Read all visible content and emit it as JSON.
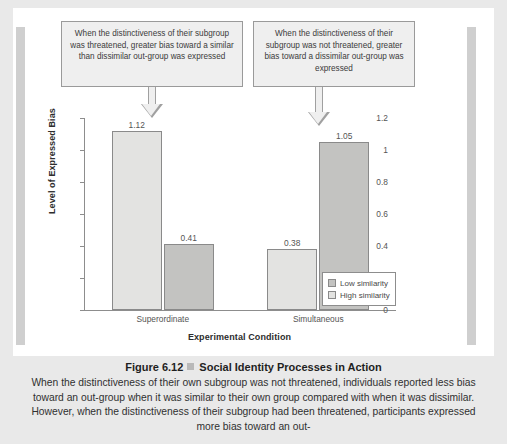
{
  "chart_data": {
    "type": "bar",
    "title": "",
    "xlabel": "Experimental Condition",
    "ylabel": "Level of Expressed Bias",
    "ylim": [
      0,
      1.2
    ],
    "yticks": [
      "0",
      "0.2",
      "0.4",
      "0.6",
      "0.8",
      "1",
      "1.2"
    ],
    "ytick_values": [
      0,
      0.2,
      0.4,
      0.6,
      0.8,
      1,
      1.2
    ],
    "grid": false,
    "legend_position": "bottom-right",
    "categories": [
      "Superordinate",
      "Simultaneous"
    ],
    "series": [
      {
        "name": "High similarity",
        "values": [
          1.12,
          0.38
        ],
        "color": "#e3e3e1"
      },
      {
        "name": "Low similarity",
        "values": [
          0.41,
          1.05
        ],
        "color": "#c3c3c1"
      }
    ],
    "bars": [
      {
        "category": "Superordinate",
        "series": "High similarity",
        "value": 1.12,
        "label": "1.12"
      },
      {
        "category": "Superordinate",
        "series": "Low similarity",
        "value": 0.41,
        "label": "0.41"
      },
      {
        "category": "Simultaneous",
        "series": "High similarity",
        "value": 0.38,
        "label": "0.38"
      },
      {
        "category": "Simultaneous",
        "series": "Low similarity",
        "value": 1.05,
        "label": "1.05"
      }
    ],
    "annotations": [
      {
        "name": "callout-left",
        "text": "When the distinctiveness of their subgroup was threatened, greater bias toward a similar than dissimilar out-group was expressed",
        "points_to": "Superordinate / High similarity bar"
      },
      {
        "name": "callout-right",
        "text": "When the distinctiveness of their subgroup was not threatened, greater bias toward a dissimilar out-group was expressed",
        "points_to": "Simultaneous / Low similarity bar"
      }
    ]
  },
  "legend": {
    "entries": [
      {
        "label": "Low similarity",
        "swatch": "low"
      },
      {
        "label": "High similarity",
        "swatch": "high"
      }
    ]
  },
  "caption": {
    "figure_number": "Figure 6.12",
    "separator_icon": "gray-square-icon",
    "title": "Social Identity Processes in Action",
    "body": "When the distinctiveness of their own subgroup was not threatened, individuals reported less bias toward an out-group when it was similar to their own group compared with when it was dissimilar. However, when the distinctiveness of their subgroup had been threatened, participants expressed more bias toward an out-"
  },
  "colors": {
    "page_background": "#e9e9e9",
    "card_background": "#ffffff",
    "side_rule": "#cfcfcf",
    "axis": "#8d8d8d",
    "bar_high_similarity": "#e3e3e1",
    "bar_low_similarity": "#c3c3c1",
    "callout_fill": "#efefef",
    "callout_border": "#9a9a9a"
  }
}
